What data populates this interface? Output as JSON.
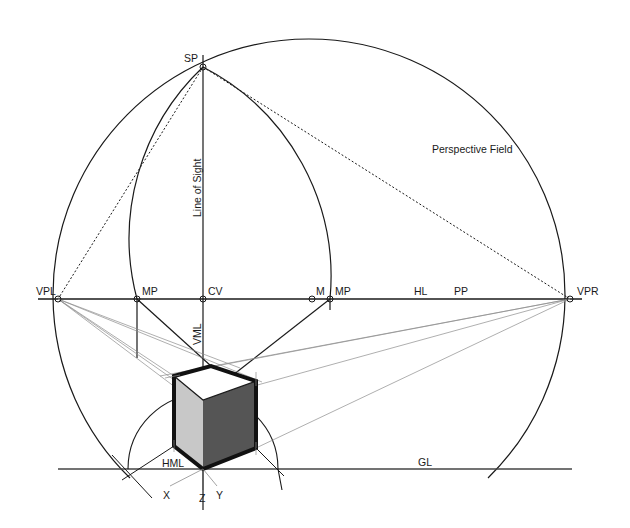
{
  "diagram": {
    "colors": {
      "line": "#1a1a1a",
      "thin_line": "#8c8c8c",
      "cube_left_face": "#c8c8c8",
      "cube_right_face": "#555555",
      "cube_top_face": "#ffffff",
      "background": "#ffffff"
    },
    "labels": {
      "sp": "SP",
      "vpl": "VPL",
      "vpr": "VPR",
      "mp_left": "MP",
      "cv": "CV",
      "m": "M",
      "mp_right": "MP",
      "hl": "HL",
      "pp": "PP",
      "gl": "GL",
      "hml": "HML",
      "vml": "VML",
      "line_of_sight": "Line of Sight",
      "perspective_field": "Perspective Field",
      "axis_x": "X",
      "axis_y": "Y",
      "axis_z": "Z"
    },
    "points": {
      "SP": [
        203,
        67
      ],
      "VPL": [
        58,
        299
      ],
      "VPR": [
        570,
        299
      ],
      "MP_left": [
        137,
        299
      ],
      "CV": [
        203,
        299
      ],
      "M": [
        312,
        299
      ],
      "MP_right": [
        330,
        299
      ]
    }
  }
}
